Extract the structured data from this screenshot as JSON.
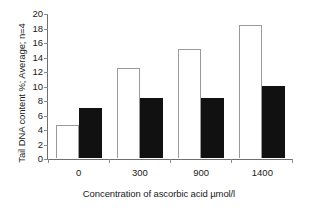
{
  "chart_data": {
    "type": "bar",
    "title": "",
    "subtitle": "",
    "xlabel": "Concentration of ascorbic acid µmol/l",
    "ylabel": "Tail DNA content %; Average; n=4",
    "categories": [
      "0",
      "300",
      "900",
      "1400"
    ],
    "series": [
      {
        "name": "open",
        "values": [
          4.6,
          12.4,
          15.0,
          18.4
        ]
      },
      {
        "name": "filled",
        "values": [
          6.9,
          8.3,
          8.3,
          10.0
        ]
      }
    ],
    "ylim": [
      0,
      20
    ],
    "ytick_values": [
      "20",
      "18",
      "16",
      "14",
      "12",
      "10",
      "8",
      "6",
      "4",
      "2",
      "0"
    ],
    "ytick_step": 2,
    "grid": false,
    "legend": "none",
    "colors": {
      "open_fill": "#ffffff",
      "open_stroke": "#9a9a9a",
      "filled_fill": "#111111",
      "axis": "#6f6f6f",
      "text": "#1a1a1a",
      "background": "#ffffff"
    }
  }
}
